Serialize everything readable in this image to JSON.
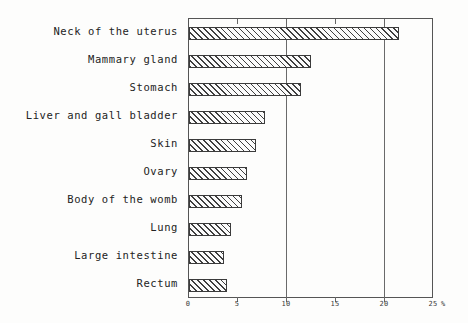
{
  "chart_data": {
    "type": "bar",
    "orientation": "horizontal",
    "title": "",
    "xlabel": "%",
    "ylabel": "",
    "xlim": [
      0,
      25
    ],
    "grid": true,
    "legend": null,
    "unit_symbol": "%",
    "xticks": [
      "0",
      "5",
      "10",
      "15",
      "20",
      "25"
    ],
    "xtick_values": [
      0,
      5,
      10,
      15,
      20,
      25
    ],
    "gridline_values": [
      10,
      20
    ],
    "categories": [
      "Neck of the uterus",
      "Mammary gland",
      "Stomach",
      "Liver and gall bladder",
      "Skin",
      "Ovary",
      "Body of the womb",
      "Lung",
      "Large intestine",
      "Rectum"
    ],
    "values": [
      21.4,
      12.4,
      11.4,
      7.8,
      6.8,
      5.9,
      5.4,
      4.3,
      3.6,
      3.9
    ],
    "bar_fill": "hatched",
    "bar_edge_color": "#3b3b3b"
  }
}
